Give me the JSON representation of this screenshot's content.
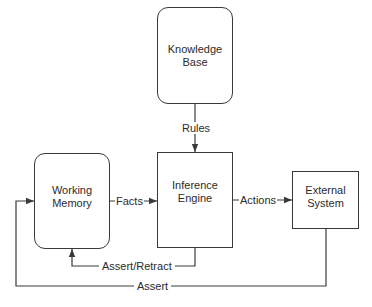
{
  "diagram": {
    "type": "block-diagram",
    "nodes": {
      "knowledge_base": {
        "line1": "Knowledge",
        "line2": "Base",
        "shape": "rounded-rect"
      },
      "working_memory": {
        "line1": "Working",
        "line2": "Memory",
        "shape": "rounded-rect"
      },
      "inference_engine": {
        "line1": "Inference",
        "line2": "Engine",
        "shape": "rect"
      },
      "external_system": {
        "line1": "External",
        "line2": "System",
        "shape": "rect"
      }
    },
    "edges": {
      "rules": {
        "label": "Rules",
        "from": "Knowledge Base",
        "to": "Inference Engine"
      },
      "facts": {
        "label": "Facts",
        "from": "Working Memory",
        "to": "Inference Engine"
      },
      "actions": {
        "label": "Actions",
        "from": "Inference Engine",
        "to": "External System"
      },
      "assert_retract": {
        "label": "Assert/Retract",
        "from": "Inference Engine",
        "to": "Working Memory"
      },
      "assert": {
        "label": "Assert",
        "from": "External System",
        "to": "Working Memory"
      }
    },
    "colors": {
      "stroke": "#3a3a3a",
      "text": "#2b2b2b",
      "background": "#ffffff"
    }
  }
}
